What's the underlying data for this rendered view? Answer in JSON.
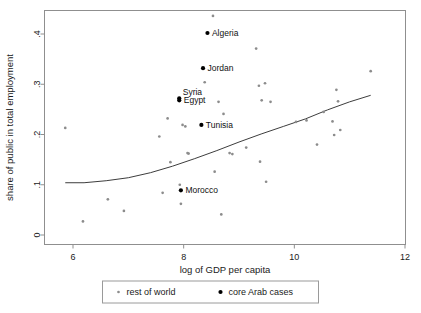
{
  "chart_data": {
    "type": "scatter",
    "title": "",
    "xlabel": "log of GDP per capita",
    "ylabel": "share of public in total employment",
    "xlim": [
      5.45,
      12.2
    ],
    "ylim": [
      -0.015,
      0.452
    ],
    "xticks": [
      6,
      8,
      10,
      12
    ],
    "xticklabels": [
      "6",
      "8",
      "10",
      "12"
    ],
    "yticks": [
      0,
      0.1,
      0.2,
      0.3,
      0.4
    ],
    "yticklabels": [
      "0",
      ".1",
      ".2",
      ".3",
      ".4"
    ],
    "grid": false,
    "legend_position": "below-center",
    "series": [
      {
        "name": "rest of world",
        "marker": "small-dot",
        "color": "#8c8c8c",
        "points": [
          {
            "x": 5.86,
            "y": 0.213
          },
          {
            "x": 6.18,
            "y": 0.027
          },
          {
            "x": 6.63,
            "y": 0.071
          },
          {
            "x": 6.92,
            "y": 0.048
          },
          {
            "x": 7.56,
            "y": 0.196
          },
          {
            "x": 7.62,
            "y": 0.084
          },
          {
            "x": 7.71,
            "y": 0.232
          },
          {
            "x": 7.76,
            "y": 0.145
          },
          {
            "x": 7.93,
            "y": 0.1
          },
          {
            "x": 7.95,
            "y": 0.062
          },
          {
            "x": 7.98,
            "y": 0.219
          },
          {
            "x": 8.03,
            "y": 0.216
          },
          {
            "x": 8.07,
            "y": 0.163
          },
          {
            "x": 8.09,
            "y": 0.162
          },
          {
            "x": 8.38,
            "y": 0.304
          },
          {
            "x": 8.53,
            "y": 0.436
          },
          {
            "x": 8.56,
            "y": 0.126
          },
          {
            "x": 8.63,
            "y": 0.265
          },
          {
            "x": 8.68,
            "y": 0.041
          },
          {
            "x": 8.72,
            "y": 0.241
          },
          {
            "x": 8.83,
            "y": 0.163
          },
          {
            "x": 8.88,
            "y": 0.161
          },
          {
            "x": 9.13,
            "y": 0.174
          },
          {
            "x": 9.31,
            "y": 0.371
          },
          {
            "x": 9.36,
            "y": 0.297
          },
          {
            "x": 9.38,
            "y": 0.146
          },
          {
            "x": 9.41,
            "y": 0.268
          },
          {
            "x": 9.47,
            "y": 0.302
          },
          {
            "x": 9.49,
            "y": 0.106
          },
          {
            "x": 9.57,
            "y": 0.265
          },
          {
            "x": 10.03,
            "y": 0.225
          },
          {
            "x": 10.22,
            "y": 0.228
          },
          {
            "x": 10.41,
            "y": 0.18
          },
          {
            "x": 10.53,
            "y": 0.245
          },
          {
            "x": 10.69,
            "y": 0.226
          },
          {
            "x": 10.72,
            "y": 0.199
          },
          {
            "x": 10.76,
            "y": 0.289
          },
          {
            "x": 10.79,
            "y": 0.266
          },
          {
            "x": 10.83,
            "y": 0.209
          },
          {
            "x": 11.38,
            "y": 0.326
          }
        ]
      },
      {
        "name": "core Arab cases",
        "marker": "dot",
        "color": "#000000",
        "points": [
          {
            "x": 8.43,
            "y": 0.402,
            "label": "Algeria"
          },
          {
            "x": 8.35,
            "y": 0.332,
            "label": "Jordan"
          },
          {
            "x": 7.92,
            "y": 0.272,
            "label": "Syria"
          },
          {
            "x": 7.92,
            "y": 0.268,
            "label": "Egypt"
          },
          {
            "x": 8.32,
            "y": 0.219,
            "label": "Tunisia"
          },
          {
            "x": 7.95,
            "y": 0.089,
            "label": "Morocco"
          }
        ]
      }
    ],
    "fit_line": {
      "name": "lowess fit",
      "color": "#3d3d3d",
      "points": [
        {
          "x": 5.86,
          "y": 0.104
        },
        {
          "x": 6.2,
          "y": 0.104
        },
        {
          "x": 6.6,
          "y": 0.108
        },
        {
          "x": 7.0,
          "y": 0.114
        },
        {
          "x": 7.4,
          "y": 0.124
        },
        {
          "x": 7.8,
          "y": 0.137
        },
        {
          "x": 8.2,
          "y": 0.152
        },
        {
          "x": 8.6,
          "y": 0.168
        },
        {
          "x": 9.0,
          "y": 0.185
        },
        {
          "x": 9.4,
          "y": 0.201
        },
        {
          "x": 9.8,
          "y": 0.216
        },
        {
          "x": 10.2,
          "y": 0.231
        },
        {
          "x": 10.6,
          "y": 0.249
        },
        {
          "x": 11.0,
          "y": 0.265
        },
        {
          "x": 11.38,
          "y": 0.278
        }
      ]
    },
    "legend": [
      {
        "label": "rest of world",
        "marker": "small-dot",
        "color": "#8c8c8c"
      },
      {
        "label": "core Arab cases",
        "marker": "dot",
        "color": "#000000"
      }
    ]
  }
}
